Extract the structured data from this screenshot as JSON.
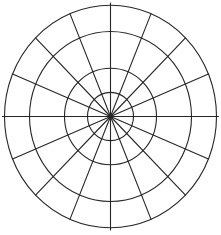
{
  "diagram": {
    "type": "polar-grid",
    "center": {
      "x": 110.5,
      "y": 116.5
    },
    "scale": {
      "x": 1.0,
      "y": 1.05
    },
    "rings": [
      {
        "radius": 23
      },
      {
        "radius": 46
      },
      {
        "radius": 81
      },
      {
        "radius": 106
      }
    ],
    "spoke_count": 16,
    "spoke_angle_step_deg": 22.5,
    "spoke_overshoot": 2,
    "colors": {
      "background": "#ffffff",
      "line": "#262626"
    },
    "line_width": 1.1
  }
}
